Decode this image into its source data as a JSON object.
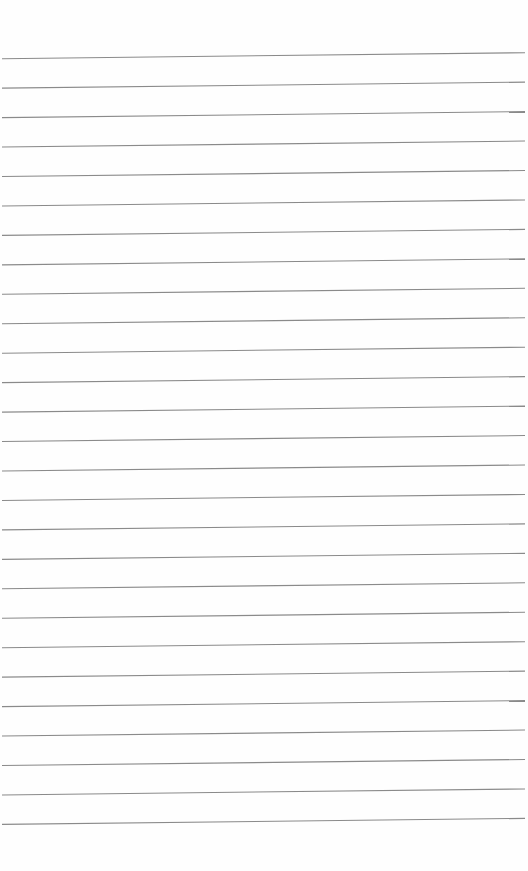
{
  "page": {
    "type": "lined-paper",
    "background_color": "#fefefe",
    "text_content": ""
  },
  "ruling": {
    "line_count": 27,
    "line_color": "#8a8a8a",
    "line_width": 1.1,
    "first_line_left_y": 58.7,
    "first_line_right_y": 52.7,
    "spacing": 29.45,
    "x_start": 2,
    "x_end": 525
  }
}
